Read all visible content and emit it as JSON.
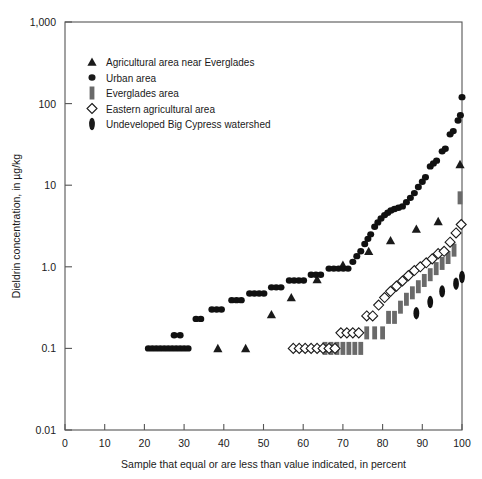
{
  "chart_data": {
    "type": "scatter",
    "title": "",
    "xlabel": "Sample that equal or are less than value indicated, in percent",
    "ylabel": "Dieldrin concentration, in µg/kg",
    "xlim": [
      0,
      100
    ],
    "ylim": [
      0.01,
      1000
    ],
    "yscale": "log",
    "grid": false,
    "legend_position": "upper-left",
    "xticks": [
      "0",
      "10",
      "20",
      "30",
      "40",
      "50",
      "60",
      "70",
      "80",
      "90",
      "100"
    ],
    "xtick_values": [
      0,
      10,
      20,
      30,
      40,
      50,
      60,
      70,
      80,
      90,
      100
    ],
    "yticks": [
      "0.01",
      "0.1",
      "1.0",
      "10",
      "100",
      "1,000"
    ],
    "ytick_values": [
      0.01,
      0.1,
      1,
      10,
      100,
      1000
    ],
    "series": [
      {
        "name": "Agricultural area near Everglades",
        "marker": "triangle",
        "color": "#1a1a1a",
        "points": [
          [
            38.5,
            0.1
          ],
          [
            45.5,
            0.1
          ],
          [
            52.0,
            0.26
          ],
          [
            57.0,
            0.42
          ],
          [
            63.5,
            0.7
          ],
          [
            70.0,
            1.05
          ],
          [
            76.5,
            1.55
          ],
          [
            82.0,
            2.1
          ],
          [
            88.5,
            2.9
          ],
          [
            94.0,
            3.6
          ],
          [
            99.5,
            18.0
          ]
        ]
      },
      {
        "name": "Urban area",
        "marker": "circle",
        "color": "#111111",
        "points": [
          [
            21.0,
            0.1
          ],
          [
            22.0,
            0.1
          ],
          [
            23.0,
            0.1
          ],
          [
            24.0,
            0.1
          ],
          [
            25.0,
            0.1
          ],
          [
            26.0,
            0.1
          ],
          [
            27.0,
            0.1
          ],
          [
            28.0,
            0.1
          ],
          [
            29.0,
            0.1
          ],
          [
            30.0,
            0.1
          ],
          [
            31.0,
            0.1
          ],
          [
            27.5,
            0.145
          ],
          [
            29.0,
            0.145
          ],
          [
            33.0,
            0.23
          ],
          [
            34.2,
            0.23
          ],
          [
            37.0,
            0.3
          ],
          [
            38.2,
            0.3
          ],
          [
            39.4,
            0.3
          ],
          [
            42.0,
            0.39
          ],
          [
            43.2,
            0.39
          ],
          [
            44.4,
            0.39
          ],
          [
            46.5,
            0.47
          ],
          [
            47.7,
            0.47
          ],
          [
            48.9,
            0.47
          ],
          [
            50.1,
            0.47
          ],
          [
            52.0,
            0.56
          ],
          [
            53.2,
            0.56
          ],
          [
            54.4,
            0.56
          ],
          [
            56.5,
            0.68
          ],
          [
            57.7,
            0.68
          ],
          [
            58.9,
            0.68
          ],
          [
            60.1,
            0.68
          ],
          [
            62.0,
            0.8
          ],
          [
            63.2,
            0.8
          ],
          [
            64.4,
            0.8
          ],
          [
            66.5,
            0.95
          ],
          [
            67.7,
            0.95
          ],
          [
            68.9,
            0.95
          ],
          [
            70.1,
            0.95
          ],
          [
            71.3,
            0.95
          ],
          [
            72.5,
            1.15
          ],
          [
            73.5,
            1.35
          ],
          [
            74.5,
            1.55
          ],
          [
            75.5,
            1.9
          ],
          [
            76.3,
            2.2
          ],
          [
            77.0,
            2.5
          ],
          [
            78.0,
            3.1
          ],
          [
            78.8,
            3.5
          ],
          [
            79.6,
            3.9
          ],
          [
            80.5,
            4.3
          ],
          [
            81.3,
            4.6
          ],
          [
            82.1,
            4.9
          ],
          [
            83.0,
            5.1
          ],
          [
            84.0,
            5.3
          ],
          [
            85.0,
            5.5
          ],
          [
            86.0,
            6.2
          ],
          [
            87.0,
            7.0
          ],
          [
            88.0,
            8.0
          ],
          [
            89.0,
            9.5
          ],
          [
            90.0,
            11.0
          ],
          [
            90.8,
            12.5
          ],
          [
            92.0,
            17.0
          ],
          [
            92.8,
            18.5
          ],
          [
            93.6,
            20.0
          ],
          [
            95.0,
            26.0
          ],
          [
            95.8,
            28.0
          ],
          [
            97.0,
            42.0
          ],
          [
            97.8,
            46.0
          ],
          [
            99.0,
            62.0
          ],
          [
            99.6,
            72.0
          ],
          [
            100.0,
            120.0
          ]
        ]
      },
      {
        "name": "Everglades area",
        "marker": "bar",
        "color": "#6a6a6a",
        "points": [
          [
            65.5,
            0.1
          ],
          [
            67.0,
            0.1
          ],
          [
            68.5,
            0.1
          ],
          [
            70.0,
            0.1
          ],
          [
            71.5,
            0.1
          ],
          [
            73.0,
            0.1
          ],
          [
            74.5,
            0.1
          ],
          [
            76.0,
            0.155
          ],
          [
            78.0,
            0.155
          ],
          [
            80.0,
            0.155
          ],
          [
            81.5,
            0.24
          ],
          [
            83.0,
            0.24
          ],
          [
            84.5,
            0.32
          ],
          [
            86.0,
            0.4
          ],
          [
            87.5,
            0.48
          ],
          [
            89.0,
            0.57
          ],
          [
            90.5,
            0.68
          ],
          [
            92.0,
            0.8
          ],
          [
            93.5,
            0.95
          ],
          [
            95.0,
            1.1
          ],
          [
            96.5,
            1.3
          ],
          [
            98.0,
            1.6
          ],
          [
            99.5,
            7.0
          ]
        ]
      },
      {
        "name": "Eastern agricultural area",
        "marker": "diamond",
        "color": "#1a1a1a",
        "points": [
          [
            57.5,
            0.1
          ],
          [
            59.0,
            0.1
          ],
          [
            60.5,
            0.1
          ],
          [
            62.0,
            0.1
          ],
          [
            63.5,
            0.1
          ],
          [
            65.0,
            0.1
          ],
          [
            66.5,
            0.1
          ],
          [
            68.0,
            0.1
          ],
          [
            69.5,
            0.155
          ],
          [
            71.0,
            0.155
          ],
          [
            72.5,
            0.155
          ],
          [
            74.0,
            0.155
          ],
          [
            76.0,
            0.25
          ],
          [
            77.5,
            0.25
          ],
          [
            79.0,
            0.34
          ],
          [
            80.5,
            0.42
          ],
          [
            82.0,
            0.5
          ],
          [
            83.5,
            0.58
          ],
          [
            85.0,
            0.67
          ],
          [
            86.5,
            0.78
          ],
          [
            88.0,
            0.9
          ],
          [
            89.5,
            1.0
          ],
          [
            91.0,
            1.12
          ],
          [
            92.5,
            1.25
          ],
          [
            94.0,
            1.45
          ],
          [
            95.5,
            1.55
          ],
          [
            97.0,
            2.0
          ],
          [
            98.5,
            2.6
          ],
          [
            99.8,
            3.3
          ]
        ]
      },
      {
        "name": "Undeveloped Big Cypress watershed",
        "marker": "oval",
        "color": "#111111",
        "points": [
          [
            88.5,
            0.27
          ],
          [
            92.0,
            0.37
          ],
          [
            95.0,
            0.5
          ],
          [
            98.5,
            0.62
          ],
          [
            100.0,
            0.75
          ]
        ]
      }
    ]
  },
  "legend": {
    "items": [
      {
        "label": "Agricultural area near Everglades",
        "marker": "triangle"
      },
      {
        "label": "Urban area",
        "marker": "circle"
      },
      {
        "label": "Everglades area",
        "marker": "bar"
      },
      {
        "label": "Eastern agricultural area",
        "marker": "diamond"
      },
      {
        "label": "Undeveloped Big Cypress watershed",
        "marker": "oval"
      }
    ]
  }
}
